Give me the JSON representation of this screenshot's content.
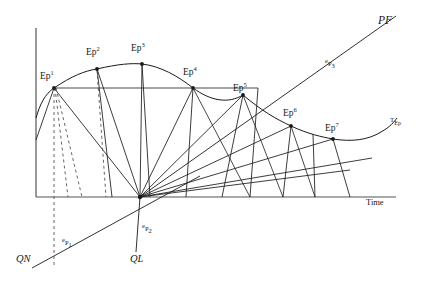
{
  "figure": {
    "title_visible": false,
    "background_color": "#ffffff",
    "line_color": "#1a1a1a",
    "axis_color": "#4a4a4a"
  },
  "axes": {
    "x_axis_label": "Time",
    "y_axis_label": "",
    "x_axis": {
      "x1": 36,
      "y1": 197,
      "x2": 396,
      "y2": 197
    },
    "y_axis": {
      "x1": 36,
      "y1": 28,
      "x2": 36,
      "y2": 197
    }
  },
  "curve_label": {
    "main": "T",
    "sub": "Ep",
    "x": 392,
    "y": 124
  },
  "pf_line": {
    "label": "PF",
    "label_x": 378,
    "label_y": 24,
    "mid_label_pre": "e",
    "mid_label_main": "P",
    "mid_label_sub": "3",
    "mid_label_x": 325,
    "mid_label_y": 66
  },
  "baseline_labels": [
    {
      "name": "qn-label",
      "text": "QN",
      "x": 16,
      "y": 262
    },
    {
      "name": "ql-label",
      "text": "QL",
      "x": 130,
      "y": 262
    }
  ],
  "ray_labels": [
    {
      "name": "ep1-ray-label",
      "pre": "e",
      "main": "P",
      "sub": "1",
      "x": 62,
      "y": 245
    },
    {
      "name": "ep2-ray-label",
      "pre": "e",
      "main": "P",
      "sub": "2",
      "x": 142,
      "y": 231
    }
  ],
  "ep_points": [
    {
      "id": "Ep1",
      "main": "Ep",
      "sup": "1",
      "x": 54,
      "y": 88,
      "label_x": 40,
      "label_y": 79
    },
    {
      "id": "Ep2",
      "main": "Ep",
      "sup": "2",
      "x": 97,
      "y": 69,
      "label_x": 86,
      "label_y": 55
    },
    {
      "id": "Ep3",
      "main": "Ep",
      "sup": "3",
      "x": 142,
      "y": 64,
      "label_x": 131,
      "label_y": 51
    },
    {
      "id": "Ep4",
      "main": "Ep",
      "sup": "4",
      "x": 193,
      "y": 88,
      "label_x": 183,
      "label_y": 75
    },
    {
      "id": "Ep5",
      "main": "Ep",
      "sup": "5",
      "x": 243,
      "y": 95,
      "label_x": 233,
      "label_y": 90
    },
    {
      "id": "Ep6",
      "main": "Ep",
      "sup": "6",
      "x": 291,
      "y": 126,
      "label_x": 283,
      "label_y": 115
    },
    {
      "id": "Ep7",
      "main": "Ep",
      "sup": "7",
      "x": 333,
      "y": 139,
      "label_x": 325,
      "label_y": 130
    }
  ],
  "convergence_point": {
    "name": "fan-origin",
    "x": 140,
    "y": 197
  },
  "horizontal_level_line": {
    "y": 88,
    "x1": 54,
    "x2": 258
  },
  "curve_path": "M 36,118 C 40,104 45,94 54,88 C 72,76 84,71 97,69 C 118,64 132,63 142,64 C 160,66 178,76 193,88 C 211,101 228,104 243,95 C 262,111 276,119 291,126 C 308,134 322,137 333,139 C 352,142 368,140 381,132 C 390,127 394,122 397,118",
  "pf_path": "M 140,197 L 396,16",
  "qn_path": "M 36,268 L 196,178",
  "drop_lines_x": [
    222,
    250,
    283,
    315,
    350
  ],
  "dashed_lines": [
    {
      "name": "dashed-vertical-ep1",
      "x1": 54,
      "y1": 88,
      "x2": 54,
      "y2": 268
    },
    {
      "name": "dashed-slant-ep1-a",
      "x1": 54,
      "y1": 88,
      "x2": 70,
      "y2": 197
    },
    {
      "name": "dashed-slant-ep1-b",
      "x1": 54,
      "y1": 88,
      "x2": 83,
      "y2": 197
    },
    {
      "name": "dashed-slant-ep2",
      "x1": 97,
      "y1": 69,
      "x2": 110,
      "y2": 197
    }
  ]
}
